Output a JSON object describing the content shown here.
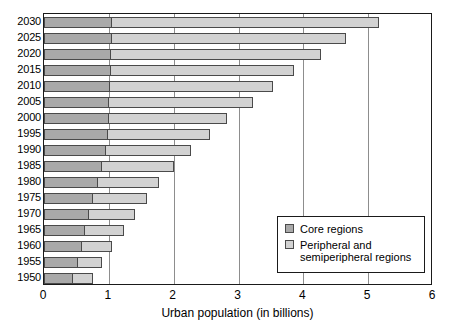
{
  "chart_data": {
    "type": "bar",
    "orientation": "horizontal",
    "stacked": true,
    "title": "",
    "xlabel": "Urban population (in billions)",
    "ylabel": "",
    "xlim": [
      0,
      6
    ],
    "xticks": [
      0,
      1,
      2,
      3,
      4,
      5,
      6
    ],
    "xtick_labels": [
      "0",
      "1",
      "2",
      "3",
      "4",
      "5",
      "6"
    ],
    "grid": "vertical gridlines at 1, 2, 3, 4, 5",
    "legend_position": "inside lower right",
    "categories": [
      "1950",
      "1955",
      "1960",
      "1965",
      "1970",
      "1975",
      "1980",
      "1985",
      "1990",
      "1995",
      "2000",
      "2005",
      "2010",
      "2015",
      "2020",
      "2025",
      "2030"
    ],
    "series": [
      {
        "name": "Core regions",
        "color": "#a9a9a9",
        "values": [
          0.45,
          0.52,
          0.58,
          0.64,
          0.7,
          0.76,
          0.83,
          0.9,
          0.95,
          0.98,
          1.0,
          1.01,
          1.02,
          1.03,
          1.04,
          1.05,
          1.05
        ]
      },
      {
        "name": "Peripheral and semiperipheral regions",
        "color": "#d2d2d2",
        "values": [
          0.3,
          0.38,
          0.47,
          0.59,
          0.71,
          0.83,
          0.94,
          1.1,
          1.32,
          1.58,
          1.82,
          2.21,
          2.51,
          2.83,
          3.24,
          3.61,
          4.12
        ]
      }
    ],
    "totals": [
      0.75,
      0.9,
      1.05,
      1.23,
      1.41,
      1.59,
      1.77,
      2.0,
      2.27,
      2.56,
      2.82,
      3.22,
      3.53,
      3.86,
      4.28,
      4.66,
      5.17
    ]
  },
  "legend": {
    "items": [
      {
        "label": "Core regions",
        "swatch": "core"
      },
      {
        "label": "Peripheral and\nsemiperipheral regions",
        "swatch": "periph"
      }
    ]
  },
  "axis": {
    "x_title": "Urban population (in billions)"
  }
}
